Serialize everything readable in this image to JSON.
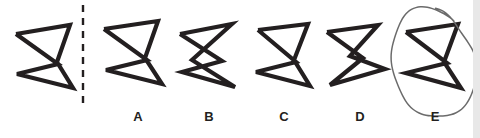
{
  "puzzle": {
    "type": "shape-matching-multiple-choice",
    "canvas": {
      "width": 480,
      "height": 138,
      "background": "#ffffff"
    },
    "stroke_color": "#231f20",
    "divider": {
      "name": "dashed-divider",
      "x": 83,
      "y_start": 5,
      "y_end": 106,
      "dash": "7,6",
      "width": 2.4,
      "color": "#231f20"
    },
    "prompt_shape": {
      "name": "reference-bowtie-shape",
      "label": "",
      "points": "16,34 70,25 57,62 73,88 17,74 58,64 16,34",
      "stroke_width": 4.2
    },
    "options": [
      {
        "id": "A",
        "label": "A",
        "name": "option-a",
        "label_x": 138,
        "label_y": 110,
        "points": "104,29 158,21 145,58 162,84 106,70 147,60 104,29",
        "stroke_width": 4.2,
        "selected": false
      },
      {
        "id": "B",
        "label": "B",
        "name": "option-b",
        "label_x": 209,
        "label_y": 110,
        "points": "180,34 232,24 192,60 235,87 182,72 222,61 180,34",
        "stroke_width": 4.2,
        "selected": false
      },
      {
        "id": "C",
        "label": "C",
        "name": "option-c",
        "label_x": 284,
        "label_y": 110,
        "points": "258,30 308,24 294,60 310,86 256,72 296,62 258,30",
        "stroke_width": 4.2,
        "selected": false
      },
      {
        "id": "D",
        "label": "D",
        "name": "option-d",
        "label_x": 360,
        "label_y": 110,
        "points": "327,32 378,25 350,56 385,69 330,85 363,58 327,32",
        "stroke_width": 4.2,
        "selected": false
      },
      {
        "id": "E",
        "label": "E",
        "name": "option-e",
        "label_x": 435,
        "label_y": 110,
        "points": "406,32 458,24 444,62 461,88 406,73 447,63 406,32",
        "stroke_width": 4.2,
        "selected": true
      }
    ],
    "selection_mark": {
      "name": "hand-drawn-circle-annotation",
      "target_option": "E",
      "cx": 433,
      "cy": 63,
      "rx": 41,
      "ry": 56,
      "rotation": -11,
      "color": "#6b6b6b",
      "stroke_width": 1.5
    },
    "right_edge_strip": {
      "name": "page-edge-strip",
      "x": 473,
      "width": 7,
      "color": "#e8e8e8"
    }
  }
}
